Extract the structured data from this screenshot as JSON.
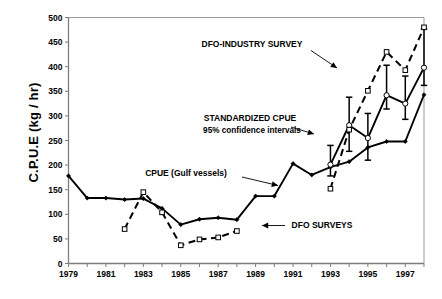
{
  "figure": {
    "title": "",
    "y_axis_title": "C.P.U.E (kg / hr)"
  },
  "annotations": {
    "dfo_industry": "DFO-INDUSTRY SURVEY",
    "standardized_line1": "STANDARDIZED CPUE",
    "standardized_line2": "95% confidence intervals",
    "cpue_gulf": "CPUE (Gulf vessels)",
    "dfo_surveys": "DFO SURVEYS"
  },
  "chart_data": {
    "type": "line",
    "title": "",
    "xlabel": "",
    "ylabel": "C.P.U.E (kg / hr)",
    "xlim": [
      1979,
      1998
    ],
    "ylim": [
      0,
      500
    ],
    "ytick_values": [
      0,
      50,
      100,
      150,
      200,
      250,
      300,
      350,
      400,
      450,
      500
    ],
    "ytick_labels": [
      "0",
      "50",
      "100",
      "150",
      "200",
      "250",
      "300",
      "350",
      "400",
      "450",
      "500"
    ],
    "xtick_values": [
      1979,
      1980,
      1981,
      1982,
      1983,
      1984,
      1985,
      1986,
      1987,
      1988,
      1989,
      1990,
      1991,
      1992,
      1993,
      1994,
      1995,
      1996,
      1997,
      1998
    ],
    "xtick_labels": [
      "1979",
      "",
      "1981",
      "",
      "1983",
      "",
      "1985",
      "",
      "1987",
      "",
      "1989",
      "",
      "1991",
      "",
      "1993",
      "",
      "1995",
      "",
      "1997",
      ""
    ],
    "grid": false,
    "legend_position": "none",
    "series": [
      {
        "name": "CPUE (Gulf vessels)",
        "style": "solid",
        "marker": "small-filled-diamond",
        "color": "#000000",
        "x": [
          1979,
          1980,
          1981,
          1982,
          1983,
          1984,
          1985,
          1986,
          1987,
          1988,
          1989,
          1990,
          1991,
          1992,
          1993,
          1994,
          1995,
          1996,
          1997,
          1998
        ],
        "y": [
          178,
          133,
          133,
          130,
          132,
          112,
          79,
          90,
          93,
          89,
          137,
          137,
          203,
          180,
          196,
          207,
          236,
          248,
          248,
          343
        ]
      },
      {
        "name": "STANDARDIZED CPUE",
        "style": "solid",
        "marker": "open-circle",
        "color": "#000000",
        "error": "95% confidence intervals",
        "x": [
          1993,
          1994,
          1995,
          1996,
          1997,
          1998
        ],
        "y": [
          201,
          281,
          255,
          342,
          325,
          398
        ],
        "y_low": [
          178,
          228,
          210,
          314,
          293,
          362
        ],
        "y_high": [
          240,
          338,
          305,
          403,
          381,
          477
        ]
      },
      {
        "name": "DFO SURVEYS",
        "style": "dashed",
        "marker": "open-square",
        "color": "#000000",
        "x": [
          1982,
          1983,
          1984,
          1985,
          1986,
          1987,
          1988
        ],
        "y": [
          70,
          145,
          104,
          37,
          49,
          53,
          66
        ]
      },
      {
        "name": "DFO-INDUSTRY SURVEY",
        "style": "dashed",
        "marker": "open-square",
        "color": "#000000",
        "x": [
          1993,
          1994,
          1995,
          1996,
          1997,
          1998
        ],
        "y": [
          152,
          272,
          351,
          430,
          393,
          480
        ]
      }
    ]
  }
}
